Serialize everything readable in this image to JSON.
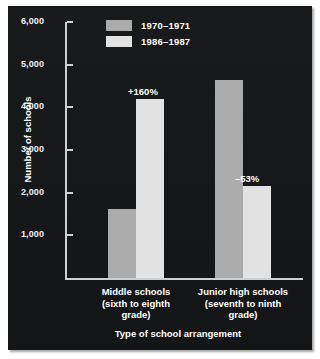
{
  "chart_data": {
    "type": "bar",
    "title": "",
    "xlabel": "Type of school arrangement",
    "ylabel": "Number of schools",
    "categories": [
      "Middle schools (sixth to eighth grade)",
      "Junior high schools (seventh to ninth grade)"
    ],
    "category_lines": [
      [
        "Middle schools",
        "(sixth to eighth",
        "grade)"
      ],
      [
        "Junior high schools",
        "(seventh to ninth",
        "grade)"
      ]
    ],
    "series": [
      {
        "name": "1970–1971",
        "values": [
          1620,
          4650
        ],
        "color": "#ababab"
      },
      {
        "name": "1986–1987",
        "values": [
          4200,
          2160
        ],
        "color": "#e2e2e2"
      }
    ],
    "annotations": [
      {
        "text": "+160%",
        "category": "Middle schools (sixth to eighth grade)",
        "series": "1986–1987"
      },
      {
        "text": "–53%",
        "category": "Junior high schools (seventh to ninth grade)",
        "series": "1986–1987"
      }
    ],
    "ylim": [
      0,
      6000
    ],
    "yticks": [
      1000,
      2000,
      3000,
      4000,
      5000,
      6000
    ],
    "ytick_labels": [
      "1,000",
      "2,000",
      "3,000",
      "4,000",
      "5,000",
      "6,000"
    ],
    "grid": false,
    "legend_position": "top-center",
    "background_color": "#17181a",
    "text_color": "#ffffff",
    "axis_color": "#cfcfcf"
  }
}
